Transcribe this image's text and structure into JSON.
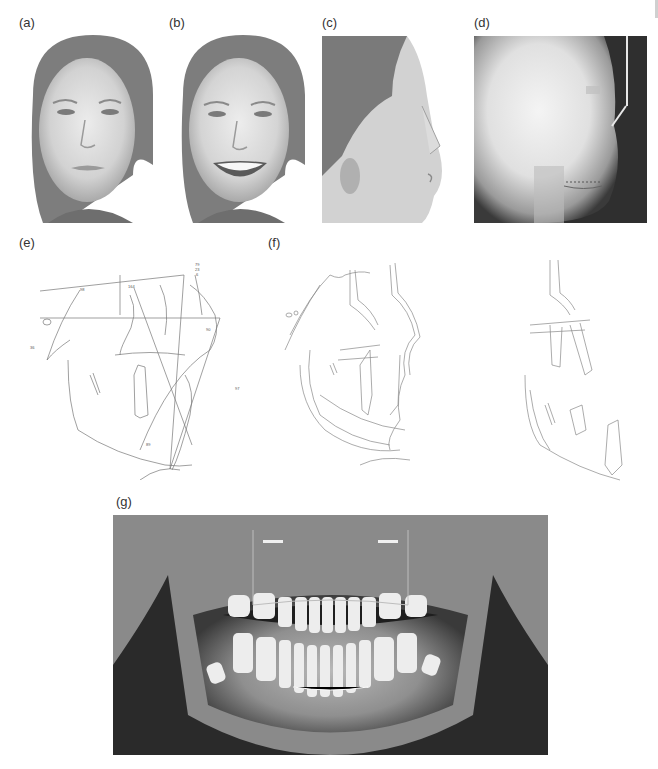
{
  "figure": {
    "panels": [
      {
        "id": "a",
        "label": "(a)",
        "content": "Frontal facial photograph, neutral expression"
      },
      {
        "id": "b",
        "label": "(b)",
        "content": "Frontal facial photograph, smiling"
      },
      {
        "id": "c",
        "label": "(c)",
        "content": "Lateral profile facial photograph"
      },
      {
        "id": "d",
        "label": "(d)",
        "content": "Lateral cephalometric radiograph"
      },
      {
        "id": "e",
        "label": "(e)",
        "content": "Cephalometric tracing with angular measurements"
      },
      {
        "id": "f",
        "label": "(f)",
        "content": "Cephalometric superimposition tracings"
      },
      {
        "id": "g",
        "label": "(g)",
        "content": "Panoramic radiograph"
      }
    ],
    "tracing_e_annotations": [
      "79",
      "23",
      "6",
      "98",
      "164",
      "36",
      "90",
      "97",
      "89"
    ]
  }
}
